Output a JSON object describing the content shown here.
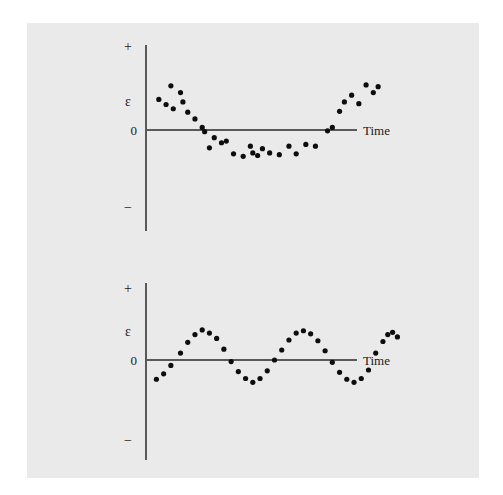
{
  "figure": {
    "background_color": "#eaeaea",
    "page_color": "#ffffff",
    "axis_color": "#595959",
    "dot_color": "#0d0d0d"
  },
  "labels": {
    "plus": "+",
    "minus": "−",
    "zero": "0",
    "epsilon": "ε",
    "time": "Time"
  },
  "chart_data": [
    {
      "type": "scatter",
      "title": "",
      "xlabel": "Time",
      "ylabel": "ε",
      "grid": false,
      "legend": "none",
      "ytick_labels": [
        "+",
        "ε",
        "0",
        "−"
      ],
      "pattern": "quadratic / U-shaped residual pattern",
      "xlim": [
        0,
        100
      ],
      "ylim": [
        -1,
        1
      ],
      "points": [
        {
          "x": 2,
          "y": 0.36
        },
        {
          "x": 5,
          "y": 0.3
        },
        {
          "x": 7,
          "y": 0.52
        },
        {
          "x": 8,
          "y": 0.25
        },
        {
          "x": 11,
          "y": 0.44
        },
        {
          "x": 12,
          "y": 0.33
        },
        {
          "x": 14,
          "y": 0.21
        },
        {
          "x": 17,
          "y": 0.13
        },
        {
          "x": 20,
          "y": 0.03
        },
        {
          "x": 21,
          "y": -0.02
        },
        {
          "x": 23,
          "y": -0.21
        },
        {
          "x": 25,
          "y": -0.09
        },
        {
          "x": 28,
          "y": -0.15
        },
        {
          "x": 30,
          "y": -0.13
        },
        {
          "x": 33,
          "y": -0.28
        },
        {
          "x": 37,
          "y": -0.31
        },
        {
          "x": 40,
          "y": -0.19
        },
        {
          "x": 41,
          "y": -0.27
        },
        {
          "x": 43,
          "y": -0.3
        },
        {
          "x": 45,
          "y": -0.22
        },
        {
          "x": 48,
          "y": -0.27
        },
        {
          "x": 52,
          "y": -0.29
        },
        {
          "x": 56,
          "y": -0.19
        },
        {
          "x": 59,
          "y": -0.28
        },
        {
          "x": 63,
          "y": -0.17
        },
        {
          "x": 67,
          "y": -0.19
        },
        {
          "x": 72,
          "y": -0.01
        },
        {
          "x": 74,
          "y": 0.03
        },
        {
          "x": 77,
          "y": 0.22
        },
        {
          "x": 79,
          "y": 0.33
        },
        {
          "x": 82,
          "y": 0.41
        },
        {
          "x": 85,
          "y": 0.31
        },
        {
          "x": 88,
          "y": 0.53
        },
        {
          "x": 91,
          "y": 0.44
        },
        {
          "x": 93,
          "y": 0.51
        }
      ]
    },
    {
      "type": "scatter",
      "title": "",
      "xlabel": "Time",
      "ylabel": "ε",
      "grid": false,
      "legend": "none",
      "ytick_labels": [
        "+",
        "ε",
        "0",
        "−"
      ],
      "pattern": "cyclical / sinusoidal residual pattern, ~3 cycles",
      "xlim": [
        0,
        100
      ],
      "ylim": [
        -1,
        1
      ],
      "points": [
        {
          "x": 1,
          "y": -0.25
        },
        {
          "x": 4,
          "y": -0.18
        },
        {
          "x": 7,
          "y": -0.07
        },
        {
          "x": 11,
          "y": 0.09
        },
        {
          "x": 14,
          "y": 0.23
        },
        {
          "x": 17,
          "y": 0.33
        },
        {
          "x": 20,
          "y": 0.39
        },
        {
          "x": 23,
          "y": 0.35
        },
        {
          "x": 26,
          "y": 0.28
        },
        {
          "x": 29,
          "y": 0.14
        },
        {
          "x": 32,
          "y": -0.02
        },
        {
          "x": 35,
          "y": -0.15
        },
        {
          "x": 38,
          "y": -0.24
        },
        {
          "x": 41,
          "y": -0.29
        },
        {
          "x": 44,
          "y": -0.24
        },
        {
          "x": 47,
          "y": -0.14
        },
        {
          "x": 50,
          "y": 0.0
        },
        {
          "x": 53,
          "y": 0.13
        },
        {
          "x": 56,
          "y": 0.26
        },
        {
          "x": 59,
          "y": 0.35
        },
        {
          "x": 62,
          "y": 0.38
        },
        {
          "x": 65,
          "y": 0.34
        },
        {
          "x": 68,
          "y": 0.25
        },
        {
          "x": 71,
          "y": 0.12
        },
        {
          "x": 74,
          "y": -0.03
        },
        {
          "x": 77,
          "y": -0.16
        },
        {
          "x": 80,
          "y": -0.25
        },
        {
          "x": 83,
          "y": -0.29
        },
        {
          "x": 86,
          "y": -0.24
        },
        {
          "x": 89,
          "y": -0.13
        },
        {
          "x": 92,
          "y": 0.09
        },
        {
          "x": 95,
          "y": 0.24
        },
        {
          "x": 97,
          "y": 0.33
        },
        {
          "x": 99,
          "y": 0.36
        },
        {
          "x": 101,
          "y": 0.3
        }
      ]
    }
  ]
}
